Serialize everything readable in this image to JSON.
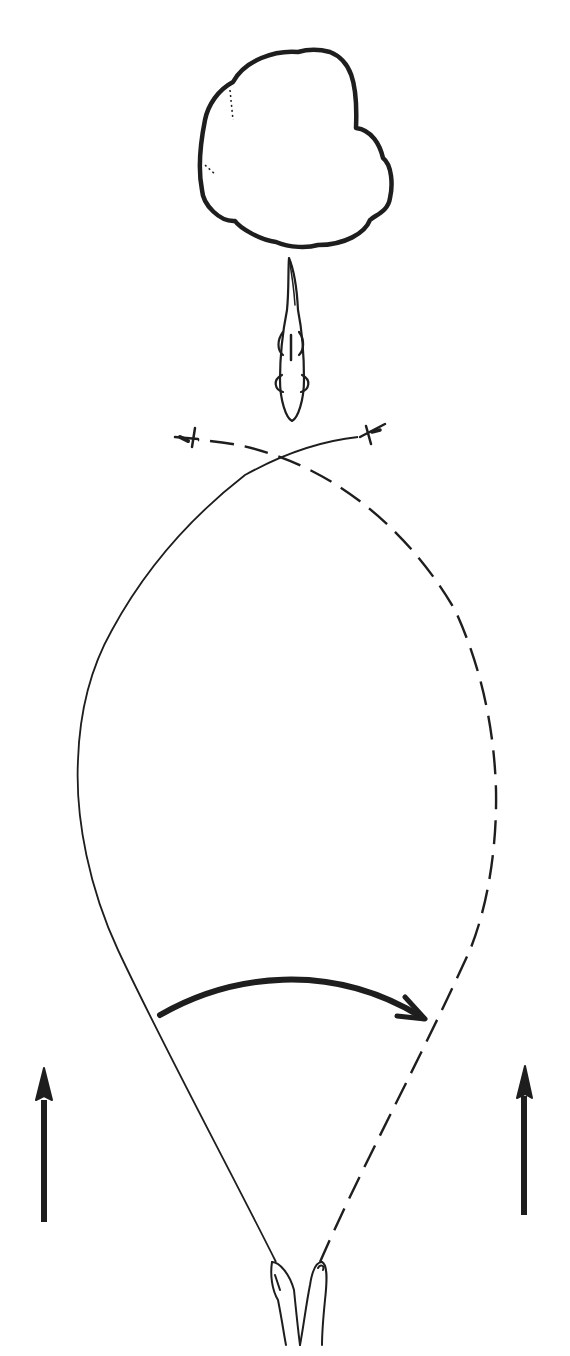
{
  "diagram": {
    "type": "illustration",
    "elements": {
      "cover": "bush-or-weed-bed outline (top)",
      "fish": "fish facing downward toward the flies",
      "fly_left": "fly at left end of solid line",
      "fly_right": "fly at right end of dashed line",
      "line_solid": "solid line path from left hand to right fly",
      "line_dashed": "dashed line path from right hand to left fly",
      "sweep_arrow": "curved arrow sweeping left to right",
      "arrow_left": "upward arrow left side",
      "arrow_right": "upward arrow right side",
      "hands": "two hands holding line at bottom"
    },
    "colors": {
      "ink": "#1e1e1e",
      "background": "#ffffff"
    }
  }
}
